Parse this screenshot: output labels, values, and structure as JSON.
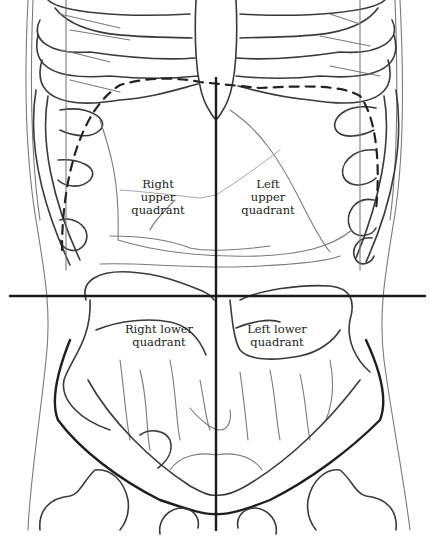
{
  "diagram": {
    "quadrants": [
      {
        "id": "ruq",
        "lines": [
          "Right",
          "upper",
          "quadrant"
        ]
      },
      {
        "id": "luq",
        "lines": [
          "Left",
          "upper",
          "quadrant"
        ]
      },
      {
        "id": "rlq",
        "lines": [
          "Right lower",
          "quadrant"
        ]
      },
      {
        "id": "llq",
        "lines": [
          "Left lower",
          "quadrant"
        ]
      }
    ],
    "dividers": {
      "vertical": {
        "x": 216,
        "y1": 78,
        "y2": 530
      },
      "horizontal": {
        "y": 296,
        "x1": 10,
        "x2": 425
      }
    },
    "colors": {
      "line": "#1e1e1e",
      "sketch": "#3a3a3a",
      "background": "#ffffff"
    }
  }
}
